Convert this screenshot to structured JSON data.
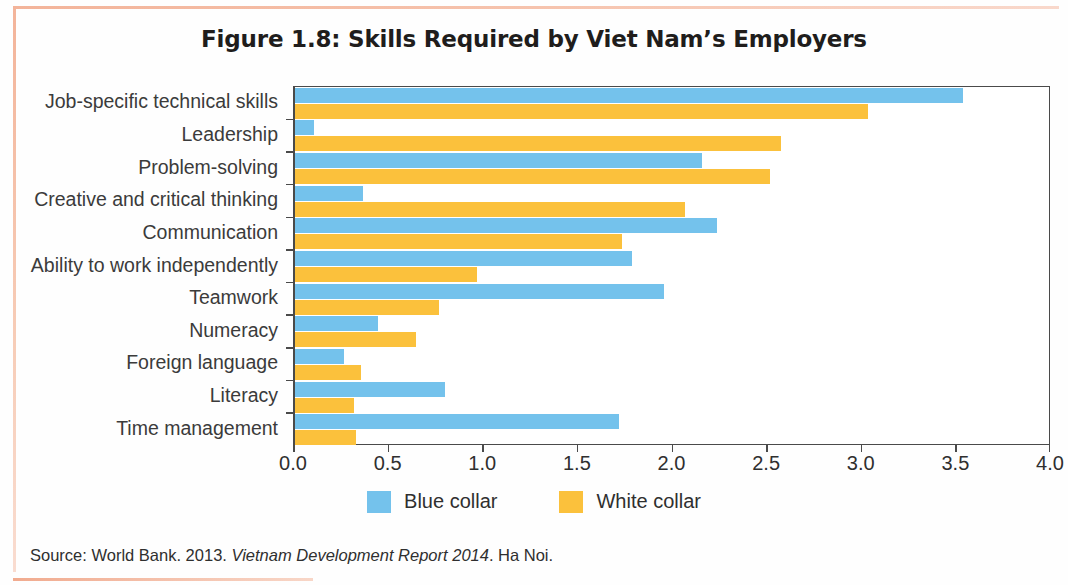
{
  "figure": {
    "title": "Figure 1.8: Skills Required by Viet Nam’s Employers",
    "source_prefix": "Source: World Bank. 2013.",
    "source_italic": "Vietnam Development Report 2014",
    "source_suffix": ". Ha Noi."
  },
  "legend": {
    "position": "bottom-center",
    "items": [
      {
        "label": "Blue collar",
        "color": "#74c2ec",
        "name": "blue-collar"
      },
      {
        "label": "White collar",
        "color": "#fbc13c",
        "name": "white-collar"
      }
    ]
  },
  "axis": {
    "x_ticks": [
      "0.0",
      "0.5",
      "1.0",
      "1.5",
      "2.0",
      "2.5",
      "3.0",
      "3.5",
      "4.0"
    ],
    "x_min": 0,
    "x_max": 4
  },
  "chart_data": {
    "type": "bar",
    "orientation": "horizontal",
    "title": "Figure 1.8: Skills Required by Viet Nam’s Employers",
    "xlabel": "",
    "ylabel": "",
    "xlim": [
      0,
      4
    ],
    "grid": false,
    "legend_position": "bottom-center",
    "categories": [
      "Job-specific technical skills",
      "Leadership",
      "Problem-solving",
      "Creative and critical thinking",
      "Communication",
      "Ability to work independently",
      "Teamwork",
      "Numeracy",
      "Foreign language",
      "Literacy",
      "Time management"
    ],
    "series": [
      {
        "name": "Blue collar",
        "color": "#74c2ec",
        "values": [
          3.53,
          0.1,
          2.15,
          0.36,
          2.23,
          1.78,
          1.95,
          0.44,
          0.26,
          0.79,
          1.71
        ]
      },
      {
        "name": "White collar",
        "color": "#fbc13c",
        "values": [
          3.03,
          2.57,
          2.51,
          2.06,
          1.73,
          0.96,
          0.76,
          0.64,
          0.35,
          0.31,
          0.32
        ]
      }
    ]
  }
}
